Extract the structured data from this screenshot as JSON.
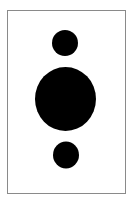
{
  "canvas": {
    "width": 136,
    "height": 203,
    "background": "#ffffff"
  },
  "frame": {
    "x": 7,
    "y": 10,
    "width": 118,
    "height": 183,
    "stroke": "#8a8a8a",
    "stroke_width": 1
  },
  "shapes": [
    {
      "name": "top-circle",
      "cx": 65,
      "cy": 43,
      "rx": 13,
      "ry": 13,
      "fill": "#000000"
    },
    {
      "name": "middle-circle",
      "cx": 65.5,
      "cy": 99,
      "rx": 30.5,
      "ry": 32,
      "fill": "#000000"
    },
    {
      "name": "bottom-circle",
      "cx": 66,
      "cy": 155,
      "rx": 13,
      "ry": 13.5,
      "fill": "#000000"
    }
  ]
}
